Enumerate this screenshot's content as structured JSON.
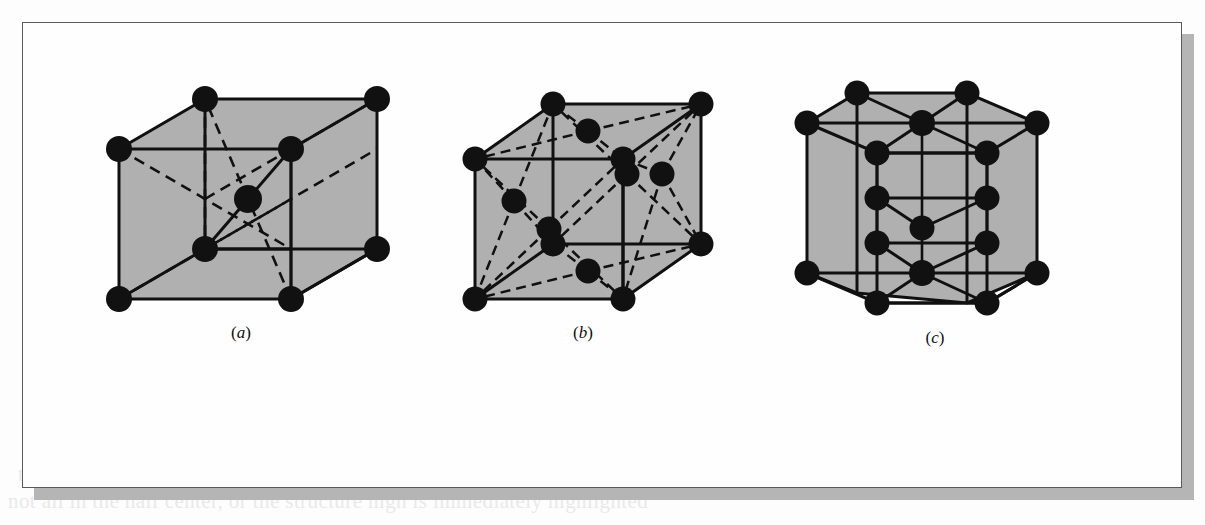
{
  "figure": {
    "kind": "crystal-structure-unit-cells",
    "background_color": "#fdfdfd",
    "frame_color": "#5a5a5a",
    "shadow_color": "#b5b5b5",
    "face_fill_color": "#b0b0b0",
    "atom_color": "#111111",
    "line_color": "#101010",
    "panels": [
      {
        "id": "a",
        "label_open": "(",
        "label_letter": "a",
        "label_close": ")",
        "structure_name": "body-centered cubic",
        "atom_count": 9
      },
      {
        "id": "b",
        "label_open": "(",
        "label_letter": "b",
        "label_close": ")",
        "structure_name": "face-centered cubic",
        "atom_count": 14
      },
      {
        "id": "c",
        "label_open": "(",
        "label_letter": "c",
        "label_close": ")",
        "structure_name": "hexagonal close-packed",
        "atom_count": 17
      }
    ]
  },
  "bleed_through_text": {
    "line_1": "toms, there the shell as hard as hard, and as such as shown, as",
    "line_2": "not all in the half center, or the structure high is immediately highlighted",
    "right_1": "FIGURE 3.3",
    "right_2": "as for each density",
    "top_faint": ""
  }
}
